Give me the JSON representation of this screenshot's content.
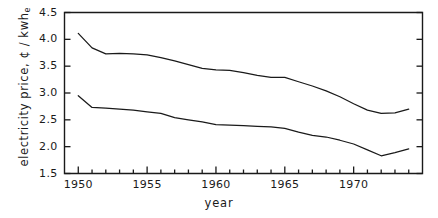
{
  "chart_data": {
    "type": "line",
    "title": "",
    "xlabel": "year",
    "ylabel": "electricity price, ¢ / kwh",
    "ylabel_sub": "e",
    "xlim": [
      1949.0,
      1975.0
    ],
    "ylim": [
      1.5,
      4.5
    ],
    "grid": false,
    "legend": "none",
    "x_ticks": [
      1950,
      1955,
      1960,
      1965,
      1970
    ],
    "x_tick_labels": [
      "1950",
      "1955",
      "1960",
      "1965",
      "1970"
    ],
    "x_minor_tick_step": 1,
    "y_ticks": [
      1.5,
      2.0,
      2.5,
      3.0,
      3.5,
      4.0,
      4.5
    ],
    "y_tick_labels": [
      "1.5",
      "2.0",
      "2.5",
      "3.0",
      "3.5",
      "4.0",
      "4.5"
    ],
    "line_color": "#1a1a1a",
    "axis_color": "#1a1a1a",
    "background": "#ffffff",
    "x": [
      1950,
      1951,
      1952,
      1953,
      1954,
      1955,
      1956,
      1957,
      1958,
      1959,
      1960,
      1961,
      1962,
      1963,
      1964,
      1965,
      1966,
      1967,
      1968,
      1969,
      1970,
      1971,
      1972,
      1973
    ],
    "series": [
      {
        "name": "upper",
        "values": [
          4.11,
          3.84,
          3.73,
          3.74,
          3.73,
          3.71,
          3.66,
          3.6,
          3.53,
          3.46,
          3.43,
          3.42,
          3.38,
          3.33,
          3.29,
          3.29,
          3.21,
          3.13,
          3.04,
          2.93,
          2.8,
          2.68,
          2.62,
          2.63
        ]
      },
      {
        "name": "lower",
        "values": [
          2.95,
          2.73,
          2.72,
          2.7,
          2.68,
          2.65,
          2.62,
          2.54,
          2.5,
          2.46,
          2.41,
          2.4,
          2.39,
          2.38,
          2.37,
          2.34,
          2.27,
          2.21,
          2.18,
          2.12,
          2.05,
          1.94,
          1.83,
          1.89
        ]
      }
    ],
    "series_tail": {
      "upper_tail_x": [
        1973,
        1974
      ],
      "upper_tail_values": [
        2.63,
        2.7
      ],
      "lower_tail_x": [
        1973,
        1974
      ],
      "lower_tail_values": [
        1.89,
        1.96
      ]
    }
  }
}
